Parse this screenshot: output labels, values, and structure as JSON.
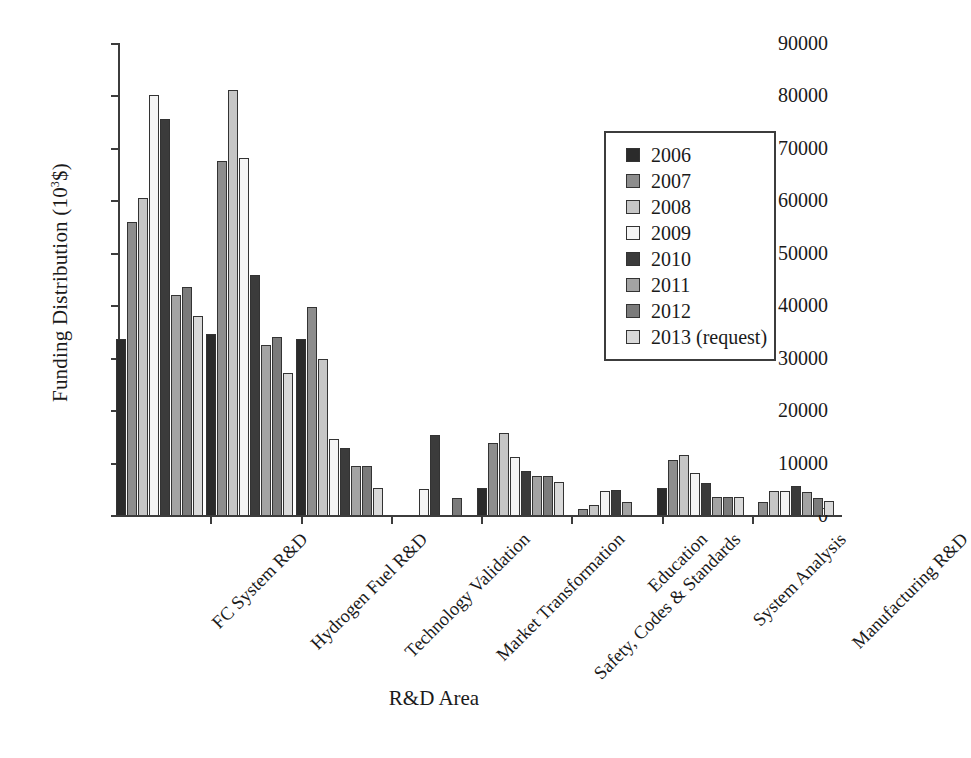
{
  "chart_data": {
    "type": "bar",
    "title": "",
    "xlabel": "R&D Area",
    "ylabel": "Funding Distribution (10³$)",
    "ylabel_main": "Funding Distribution (10",
    "ylabel_sup": "3",
    "ylabel_tail": "$)",
    "ylim": [
      0,
      90000
    ],
    "yticks": [
      0,
      10000,
      20000,
      30000,
      40000,
      50000,
      60000,
      70000,
      80000,
      90000
    ],
    "ytick_labels": [
      "0",
      "10000",
      "20000",
      "30000",
      "40000",
      "50000",
      "60000",
      "70000",
      "80000",
      "90000"
    ],
    "grid": false,
    "legend_position": "upper right",
    "categories": [
      "FC System R&D",
      "Hydrogen Fuel R&D",
      "Technology Validation",
      "Market Transformation",
      "Safety, Codes & Standards",
      "Education",
      "System Analysis",
      "Manufacturing R&D"
    ],
    "series": [
      {
        "name": "2006",
        "color": "#2b2b2b",
        "values": [
          33500,
          34500,
          33500,
          0,
          5200,
          0,
          5200,
          0
        ]
      },
      {
        "name": "2007",
        "color": "#8d8d8d",
        "values": [
          55800,
          67500,
          39600,
          0,
          13800,
          1200,
          10500,
          2400
        ]
      },
      {
        "name": "2008",
        "color": "#c6c6c6",
        "values": [
          60500,
          81000,
          29800,
          0,
          15600,
          1900,
          11400,
          4600
        ]
      },
      {
        "name": "2009",
        "color": "#f4f4f4",
        "values": [
          80000,
          68000,
          14500,
          5000,
          11000,
          4500,
          8000,
          4600
        ]
      },
      {
        "name": "2010",
        "color": "#3b3b3b",
        "values": [
          75500,
          45800,
          12800,
          15200,
          8400,
          4700,
          6200,
          5500
        ]
      },
      {
        "name": "2011",
        "color": "#a3a3a3",
        "values": [
          42000,
          32500,
          9400,
          0,
          7400,
          2400,
          3500,
          4400
        ]
      },
      {
        "name": "2012",
        "color": "#7b7b7b",
        "values": [
          43500,
          34000,
          9400,
          3200,
          7400,
          0,
          3500,
          3200
        ]
      },
      {
        "name": "2013 (request)",
        "color": "#d9d9d9",
        "values": [
          38000,
          27000,
          5200,
          0,
          6300,
          0,
          3500,
          2700
        ]
      }
    ]
  },
  "legend": {
    "entries": [
      "2006",
      "2007",
      "2008",
      "2009",
      "2010",
      "2011",
      "2012",
      "2013 (request)"
    ]
  },
  "axis": {
    "x_title": "R&D Area",
    "y_title_prefix": "Funding Distribution (10",
    "y_title_sup": "3",
    "y_title_suffix": "$)"
  }
}
